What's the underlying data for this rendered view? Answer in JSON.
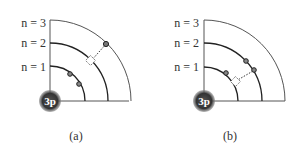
{
  "panels": [
    {
      "id": "a",
      "caption": "(a)",
      "nucleus_label": "3p",
      "shell_labels": [
        "n = 1",
        "n = 2",
        "n = 3"
      ]
    },
    {
      "id": "b",
      "caption": "(b)",
      "nucleus_label": "3p",
      "shell_labels": [
        "n = 1",
        "n = 2",
        "n = 3"
      ]
    }
  ],
  "colors": {
    "line": "#444444",
    "nucleus": "#3a3a3a",
    "electron_fill": "#777777"
  }
}
